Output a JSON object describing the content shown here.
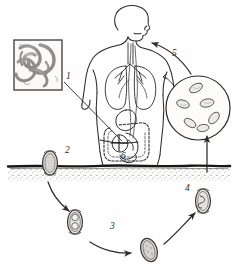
{
  "diagram": {
    "type": "parasite-life-cycle",
    "style": "hand-drawn pencil sketch, grayscale",
    "background_color": "#fefefe",
    "ink_color": "#2b2b2b",
    "soil_color": "#171717",
    "worm_fill": "#9a9a9a",
    "egg_fill": "#d8d4cf"
  },
  "labels": [
    {
      "id": "1",
      "text": "1",
      "x": 66,
      "y": 72,
      "meaning": "adult worms in intestine (inset box)"
    },
    {
      "id": "2",
      "text": "2",
      "x": 57,
      "y": 147,
      "meaning": "unfertilized/fertilized egg passed in feces onto soil"
    },
    {
      "id": "3",
      "text": "3",
      "x": 110,
      "y": 223,
      "meaning": "egg develops cleavage stage in soil"
    },
    {
      "id": "4",
      "text": "4",
      "x": 185,
      "y": 185,
      "meaning": "embryonated infective egg"
    },
    {
      "id": "5",
      "text": "5",
      "x": 172,
      "y": 50,
      "meaning": "ingestion of infective egg"
    },
    {
      "id": "6",
      "text": "6",
      "x": 121,
      "y": 153,
      "meaning": "larvae mature in small intestine"
    }
  ],
  "elements": {
    "inset_box": {
      "name": "adult-worms-inset",
      "x": 14,
      "y": 40,
      "w": 48,
      "h": 50,
      "contents": "coiled adult roundworms"
    },
    "human_figure": {
      "name": "human-body-outline",
      "parts": [
        "head",
        "mouth",
        "esophagus",
        "lungs",
        "bronchi",
        "trachea",
        "torso",
        "arms",
        "small-intestine",
        "large-intestine"
      ]
    },
    "circle_inset": {
      "name": "egg-microscopy-circle",
      "cx": 198,
      "cy": 108,
      "r": 32,
      "contents": "eggs viewed under microscope",
      "egg_count": 6
    },
    "soil_line": {
      "name": "soil-ground-line",
      "y": 166,
      "stipple_depth": 14
    },
    "eggs": [
      {
        "name": "egg-stage-2",
        "x": 50,
        "y": 163,
        "rx": 7.5,
        "ry": 12,
        "pattern": "granular"
      },
      {
        "name": "egg-stage-3",
        "x": 75,
        "y": 222,
        "rx": 7.5,
        "ry": 12,
        "pattern": "two-cell"
      },
      {
        "name": "egg-stage-3b",
        "x": 149,
        "y": 250,
        "rx": 8,
        "ry": 12,
        "pattern": "morula"
      },
      {
        "name": "egg-stage-4",
        "x": 203,
        "y": 201,
        "rx": 7.5,
        "ry": 12,
        "pattern": "larvated"
      }
    ],
    "arrows": [
      {
        "name": "arrow-egg2-to-egg3",
        "from": [
          50,
          180
        ],
        "to": [
          70,
          210
        ],
        "style": "curved"
      },
      {
        "name": "arrow-egg3-to-egg3b",
        "from": [
          92,
          246
        ],
        "to": [
          133,
          253
        ],
        "style": "curved"
      },
      {
        "name": "arrow-egg3b-to-egg4",
        "from": [
          163,
          243
        ],
        "to": [
          196,
          212
        ],
        "style": "straight"
      },
      {
        "name": "arrow-egg4-to-circle",
        "from": [
          207,
          170
        ],
        "to": [
          207,
          134
        ],
        "style": "vertical-up"
      },
      {
        "name": "arrow-circle-to-mouth",
        "from": [
          190,
          76
        ],
        "to": [
          150,
          44
        ],
        "style": "curved"
      },
      {
        "name": "pointer-inset-to-intestine",
        "from": [
          64,
          82
        ],
        "to": [
          123,
          142
        ],
        "style": "leader-line"
      }
    ]
  }
}
